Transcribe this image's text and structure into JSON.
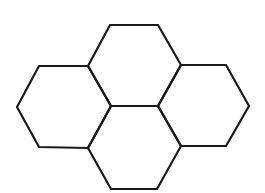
{
  "diagram": {
    "title": "",
    "stroke_color": "#1a1a1a",
    "background": "#ffffff",
    "hexagons": [
      {
        "id": "top",
        "points": "110,25 158,25 181,65 158,106 111,106 88,66"
      },
      {
        "id": "left",
        "points": "39,66 88,66 111,106 88,148 39,147 17,107"
      },
      {
        "id": "right",
        "points": "181,65 226,65 249,106 226,146 181,146 158,106"
      },
      {
        "id": "bottom",
        "points": "111,106 158,106 181,146 157,189 111,189 88,148"
      }
    ]
  }
}
